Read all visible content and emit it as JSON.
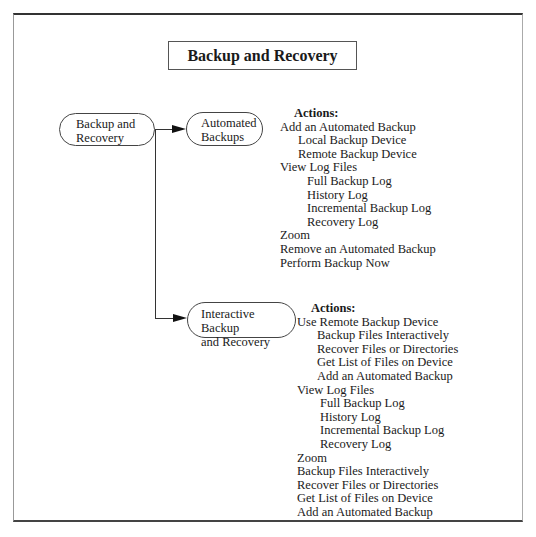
{
  "title": "Backup and Recovery",
  "nodes": {
    "root": {
      "line1": "Backup and",
      "line2": "Recovery"
    },
    "automated": {
      "line1": "Automated",
      "line2": "Backups"
    },
    "interactive": {
      "line1": "Interactive Backup",
      "line2": "and Recovery"
    }
  },
  "automated_actions": {
    "header": "Actions:",
    "items": [
      {
        "level": 0,
        "label": "Add an Automated Backup"
      },
      {
        "level": 1,
        "label": "Local Backup Device"
      },
      {
        "level": 1,
        "label": "Remote Backup Device"
      },
      {
        "level": 0,
        "label": "View Log Files"
      },
      {
        "level": 2,
        "label": "Full Backup Log"
      },
      {
        "level": 2,
        "label": "History Log"
      },
      {
        "level": 2,
        "label": "Incremental Backup Log"
      },
      {
        "level": 2,
        "label": "Recovery Log"
      },
      {
        "level": 0,
        "label": "Zoom"
      },
      {
        "level": 0,
        "label": "Remove an Automated Backup"
      },
      {
        "level": 0,
        "label": "Perform Backup Now"
      }
    ]
  },
  "interactive_actions": {
    "header": "Actions:",
    "items": [
      {
        "level": 0,
        "label": "Use Remote Backup Device"
      },
      {
        "level": 1,
        "label": "Backup Files Interactively"
      },
      {
        "level": 1,
        "label": "Recover Files or Directories"
      },
      {
        "level": 1,
        "label": "Get List of Files on Device"
      },
      {
        "level": 1,
        "label": "Add an Automated Backup"
      },
      {
        "level": 0,
        "label": "View Log Files"
      },
      {
        "level": 2,
        "label": "Full Backup Log"
      },
      {
        "level": 2,
        "label": "History Log"
      },
      {
        "level": 2,
        "label": "Incremental Backup Log"
      },
      {
        "level": 2,
        "label": "Recovery Log"
      },
      {
        "level": 0,
        "label": "Zoom"
      },
      {
        "level": 0,
        "label": "Backup Files Interactively"
      },
      {
        "level": 0,
        "label": "Recover Files or Directories"
      },
      {
        "level": 0,
        "label": "Get List of Files on Device"
      },
      {
        "level": 0,
        "label": "Add an Automated Backup"
      }
    ]
  }
}
